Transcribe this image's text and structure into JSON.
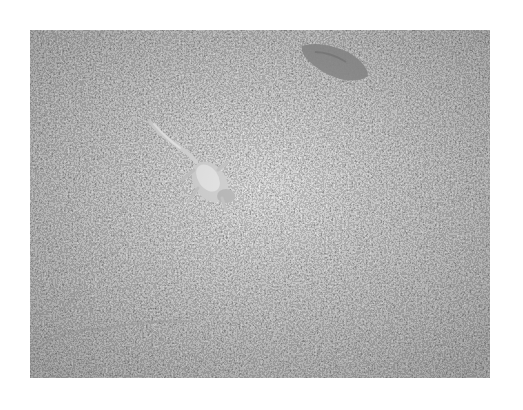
{
  "image": {
    "description": "Grayscale photograph of a small lizard on coarse gravel, with a flat stone/leaf in the upper right",
    "palette": {
      "border": "#ffffff",
      "gravel_mid": "#8a8a8a",
      "gravel_dark": "#3a3a3a",
      "gravel_light": "#e6e6e6",
      "lizard": "#d8d8d8",
      "stone": "#9c9c9c"
    },
    "subjects": [
      "lizard",
      "gravel",
      "flat-stone"
    ]
  }
}
